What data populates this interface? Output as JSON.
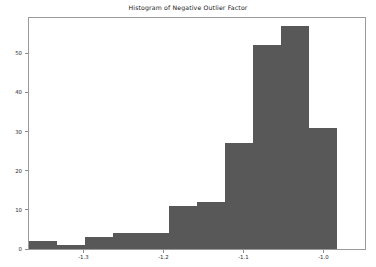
{
  "chart_data": {
    "type": "bar",
    "title": "Histogram of Negative Outlier Factor",
    "xlabel": "",
    "ylabel": "",
    "grid": false,
    "legend": null,
    "xlim": [
      -1.368,
      -0.948
    ],
    "ylim": [
      0,
      59
    ],
    "bin_width": 0.035,
    "bin_edges": [
      -1.368,
      -1.333,
      -1.298,
      -1.263,
      -1.228,
      -1.193,
      -1.158,
      -1.123,
      -1.088,
      -1.053,
      -1.018,
      -0.983
    ],
    "bin_centers": [
      -1.3505,
      -1.3155,
      -1.2805,
      -1.2455,
      -1.2105,
      -1.1755,
      -1.1405,
      -1.1055,
      -1.0705,
      -1.0355,
      -1.0005
    ],
    "values": [
      2,
      1,
      3,
      4,
      4,
      11,
      12,
      27,
      52,
      57,
      31
    ],
    "categories": [
      "-1.35",
      "-1.32",
      "-1.28",
      "-1.25",
      "-1.21",
      "-1.18",
      "-1.14",
      "-1.11",
      "-1.07",
      "-1.04",
      "-1.00"
    ],
    "bar_color": "#585858",
    "xticks": [
      {
        "value": -1.3,
        "label": "-1.3"
      },
      {
        "value": -1.2,
        "label": "-1.2"
      },
      {
        "value": -1.1,
        "label": "-1.1"
      },
      {
        "value": -1.0,
        "label": "-1.0"
      }
    ],
    "yticks": [
      {
        "value": 0,
        "label": "0"
      },
      {
        "value": 10,
        "label": "10"
      },
      {
        "value": 20,
        "label": "20"
      },
      {
        "value": 30,
        "label": "30"
      },
      {
        "value": 40,
        "label": "40"
      },
      {
        "value": 50,
        "label": "50"
      }
    ]
  },
  "figure": {
    "background": "#ffffff",
    "axis_color": "#9a9a9a",
    "tick_color": "#8c8c8c",
    "text_color": "#2b2b2b"
  }
}
